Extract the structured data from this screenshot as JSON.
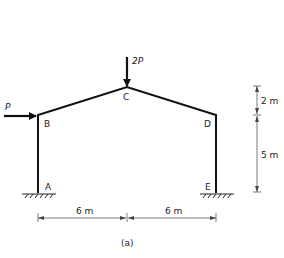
{
  "figure": {
    "caption": "(a)",
    "nodes": {
      "A": {
        "label": "A",
        "x": 38,
        "y": 193
      },
      "B": {
        "label": "B",
        "x": 38,
        "y": 115
      },
      "C": {
        "label": "C",
        "x": 127,
        "y": 87
      },
      "D": {
        "label": "D",
        "x": 216,
        "y": 115
      },
      "E": {
        "label": "E",
        "x": 216,
        "y": 193
      }
    },
    "loads": {
      "horizontal": {
        "label": "P",
        "at": "B",
        "direction": "right"
      },
      "vertical": {
        "label": "2P",
        "at": "C",
        "direction": "down"
      }
    },
    "dimensions": {
      "left_span": "6 m",
      "right_span": "6 m",
      "rise": "2 m",
      "column_height": "5 m"
    },
    "supports": {
      "A": "fixed",
      "E": "fixed"
    },
    "colors": {
      "member": "#111111",
      "dimension": "#555555",
      "text": "#222222"
    }
  }
}
